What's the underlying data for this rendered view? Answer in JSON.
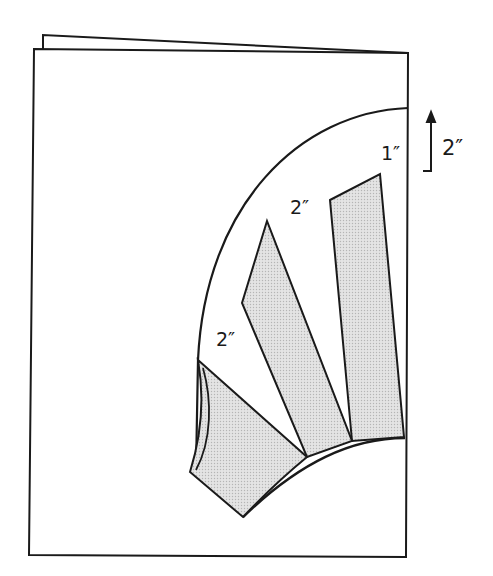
{
  "diagram": {
    "colors": {
      "line": "#1a1a1a",
      "fill": "#dcdcdc",
      "paper": "#ffffff"
    },
    "labels": {
      "top_margin": "1″",
      "middle_gap": "2″",
      "left_gap": "2″",
      "outer_dimension": "2″"
    },
    "arrow": {
      "direction": "up",
      "meaning": "dimension arrow"
    }
  }
}
